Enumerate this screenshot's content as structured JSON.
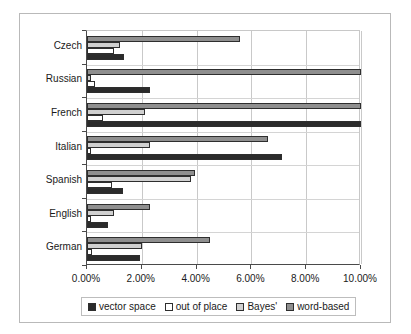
{
  "chart_data": {
    "type": "bar",
    "orientation": "horizontal",
    "title": "",
    "xlabel": "",
    "ylabel": "",
    "xlim": [
      0,
      10
    ],
    "xticks": [
      0,
      2,
      4,
      6,
      8,
      10
    ],
    "xtick_labels": [
      "0.00%",
      "2.00%",
      "4.00%",
      "6.00%",
      "8.00%",
      "10.00%"
    ],
    "grid": true,
    "legend_position": "bottom",
    "categories": [
      "Czech",
      "Russian",
      "French",
      "Italian",
      "Spanish",
      "English",
      "German"
    ],
    "series": [
      {
        "name": "vector space",
        "color": "#2b2b2b",
        "values": [
          1.35,
          2.3,
          10.0,
          7.1,
          1.3,
          0.75,
          1.95
        ]
      },
      {
        "name": "out of place",
        "color": "#ffffff",
        "values": [
          1.0,
          0.3,
          0.6,
          0.15,
          0.9,
          0.15,
          0.2
        ]
      },
      {
        "name": "Bayes'",
        "color": "#d0d0d0",
        "values": [
          1.2,
          0.15,
          2.1,
          2.3,
          3.8,
          1.0,
          2.0
        ]
      },
      {
        "name": "word-based",
        "color": "#8f8f8f",
        "values": [
          5.6,
          10.0,
          10.0,
          6.6,
          3.95,
          2.3,
          4.5
        ]
      }
    ]
  },
  "legend": {
    "items": [
      {
        "label": "vector space",
        "color": "#2b2b2b"
      },
      {
        "label": "out of place",
        "color": "#ffffff"
      },
      {
        "label": "Bayes'",
        "color": "#d0d0d0"
      },
      {
        "label": "word-based",
        "color": "#8f8f8f"
      }
    ]
  }
}
